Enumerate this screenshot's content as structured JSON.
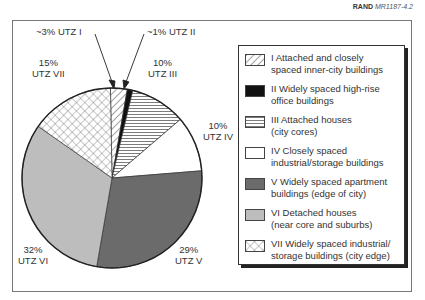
{
  "credit": {
    "org": "RAND",
    "id": "MR1187-4.2"
  },
  "chart_data": {
    "type": "pie",
    "title": "",
    "slices": [
      {
        "key": "I",
        "label": "~3% UTZ I",
        "value": 3,
        "pattern": "diagonal",
        "legend_line1": "I  Attached and closely",
        "legend_line2": "spaced inner-city buildings"
      },
      {
        "key": "II",
        "label": "~1% UTZ II",
        "value": 1,
        "pattern": "black",
        "legend_line1": "II  Widely spaced high-rise",
        "legend_line2": "office buildings"
      },
      {
        "key": "III",
        "label": "10% UTZ III",
        "value": 10,
        "pattern": "horizontal",
        "legend_line1": "III  Attached houses",
        "legend_line2": "(city cores)"
      },
      {
        "key": "IV",
        "label": "10% UTZ IV",
        "value": 10,
        "pattern": "white",
        "legend_line1": "IV  Closely spaced",
        "legend_line2": "industrial/storage buildings"
      },
      {
        "key": "V",
        "label": "29% UTZ V",
        "value": 29,
        "pattern": "dark-gray",
        "legend_line1": "V  Widely spaced apartment",
        "legend_line2": "buildings (edge of city)"
      },
      {
        "key": "VI",
        "label": "32% UTZ VI",
        "value": 32,
        "pattern": "light-gray",
        "legend_line1": "VI  Detached houses",
        "legend_line2": "(near core and suburbs)"
      },
      {
        "key": "VII",
        "label": "15% UTZ VII",
        "value": 15,
        "pattern": "crosshatch",
        "legend_line1": "VII  Widely spaced industrial/",
        "legend_line2": "storage buildings (city edge)"
      }
    ],
    "colors": {
      "dark-gray": "#6b6b6b",
      "light-gray": "#bdbdbd",
      "black": "#111111",
      "white": "#ffffff"
    },
    "legend_position": "right"
  },
  "labels": {
    "I_pct": "~3% UTZ I",
    "II_pct": "~1% UTZ II",
    "III_pct": "10%",
    "III_name": "UTZ III",
    "IV_pct": "10%",
    "IV_name": "UTZ IV",
    "V_pct": "29%",
    "V_name": "UTZ V",
    "VI_pct": "32%",
    "VI_name": "UTZ VI",
    "VII_pct": "15%",
    "VII_name": "UTZ VII"
  }
}
